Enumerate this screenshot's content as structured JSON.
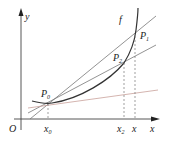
{
  "diagram": {
    "title": "",
    "axes": {
      "x_label": "x",
      "y_label": "y",
      "origin_label": "O"
    },
    "curve": {
      "label": "f",
      "color": "#333333"
    },
    "points": [
      {
        "id": "P0",
        "label": "P",
        "sub": "0",
        "x_tick": "x",
        "x_tick_sub": "0"
      },
      {
        "id": "P2",
        "label": "P",
        "sub": "2",
        "x_tick": "x",
        "x_tick_sub": "2"
      },
      {
        "id": "P1",
        "label": "P",
        "sub": "1",
        "x_tick": "x",
        "x_tick_sub": ""
      }
    ],
    "lines": [
      {
        "name": "secant-P0-P1",
        "color": "#555555"
      },
      {
        "name": "secant-P0-P2",
        "color": "#555555"
      },
      {
        "name": "tangent-at-P0",
        "color": "#c89a94"
      }
    ]
  }
}
